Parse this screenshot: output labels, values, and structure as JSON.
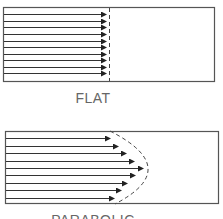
{
  "panels": [
    {
      "label": "FLAT",
      "profile": "flat",
      "box": {
        "x": 3,
        "y": 7,
        "w": 211,
        "h": 74
      },
      "front_x": 109,
      "arrows": [
        {
          "y": 14,
          "tip_x": 106
        },
        {
          "y": 21,
          "tip_x": 106
        },
        {
          "y": 27,
          "tip_x": 106
        },
        {
          "y": 34,
          "tip_x": 106
        },
        {
          "y": 41,
          "tip_x": 106
        },
        {
          "y": 47,
          "tip_x": 106
        },
        {
          "y": 54,
          "tip_x": 106
        },
        {
          "y": 60,
          "tip_x": 106
        },
        {
          "y": 67,
          "tip_x": 106
        },
        {
          "y": 73,
          "tip_x": 106
        }
      ]
    },
    {
      "label": "PARABOLIC",
      "profile": "parabolic",
      "box": {
        "x": 5,
        "y": 131,
        "w": 213,
        "h": 72
      },
      "front_curve": {
        "start": [
          110,
          131
        ],
        "apex": [
          148,
          168
        ],
        "end": [
          115,
          204
        ]
      },
      "arrows": [
        {
          "y": 138,
          "tip_x": 110
        },
        {
          "y": 146,
          "tip_x": 118
        },
        {
          "y": 153,
          "tip_x": 126
        },
        {
          "y": 161,
          "tip_x": 134
        },
        {
          "y": 168,
          "tip_x": 143
        },
        {
          "y": 175,
          "tip_x": 135
        },
        {
          "y": 183,
          "tip_x": 127
        },
        {
          "y": 190,
          "tip_x": 121
        },
        {
          "y": 198,
          "tip_x": 114
        }
      ]
    }
  ],
  "colors": {
    "stroke": "#333333",
    "border": "#555555",
    "dash": "#444444",
    "label": "#666666"
  }
}
